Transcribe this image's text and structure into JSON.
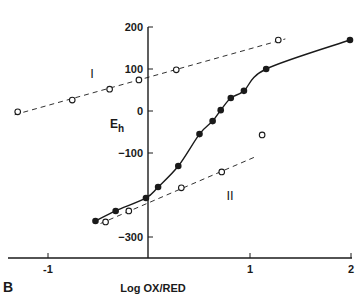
{
  "chart_data": {
    "type": "scatter",
    "title": "",
    "panel_label": "B",
    "xlabel": "Log OX/RED",
    "ylabel": "E",
    "ylabel_sub": "h",
    "xlim": [
      -1.35,
      2.0
    ],
    "ylim": [
      -350,
      200
    ],
    "x_ticks": [
      -1,
      1,
      2
    ],
    "x_tick_labels": [
      "-1",
      "1",
      "2"
    ],
    "y_ticks": [
      200,
      100,
      0,
      -100,
      -300
    ],
    "y_tick_labels": [
      "200",
      "100",
      "0",
      "−100",
      "−300"
    ],
    "grid": false,
    "legend": null,
    "series": [
      {
        "name": "filled",
        "marker": "filled-circle",
        "line": "solid-curve",
        "x": [
          -0.53,
          -0.33,
          -0.03,
          0.09,
          0.29,
          0.5,
          0.63,
          0.71,
          0.81,
          0.94,
          1.16,
          1.99
        ],
        "y": [
          -262,
          -238,
          -207,
          -181,
          -131,
          -55,
          -24,
          2,
          31,
          48,
          100,
          169
        ]
      },
      {
        "name": "I",
        "marker": "open-circle",
        "line": "dashed",
        "x": [
          -1.3,
          -0.76,
          -0.39,
          -0.1,
          0.27,
          1.28
        ],
        "y": [
          -2,
          26,
          52,
          74,
          98,
          169
        ]
      },
      {
        "name": "II",
        "marker": "open-circle",
        "line": "dashed",
        "x": [
          -0.43,
          -0.2,
          0.32,
          0.72,
          1.12
        ],
        "y": [
          -264,
          -238,
          -183,
          -145,
          -57
        ]
      }
    ],
    "annotations": [
      {
        "text": "I",
        "x": -0.55,
        "y": 75
      },
      {
        "text": "II",
        "x": 0.85,
        "y": -195
      }
    ]
  },
  "colors": {
    "ink": "#1a1a1a",
    "background": "#ffffff"
  }
}
